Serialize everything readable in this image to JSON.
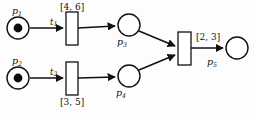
{
  "diagram": {
    "type": "timed-petri-net",
    "title": "",
    "background_color": "#fdfdfd",
    "stroke_color": "#111111",
    "token_color": "#0d0d0d"
  },
  "places": [
    {
      "id": "p1",
      "label": "p",
      "subscript": "1",
      "tokens": 1,
      "cx": 18,
      "cy": 28,
      "r": 11
    },
    {
      "id": "p2",
      "label": "p",
      "subscript": "2",
      "tokens": 1,
      "cx": 18,
      "cy": 78,
      "r": 11
    },
    {
      "id": "p3",
      "label": "p",
      "subscript": "3",
      "tokens": 0,
      "cx": 129,
      "cy": 25,
      "r": 11
    },
    {
      "id": "p4",
      "label": "p",
      "subscript": "4",
      "tokens": 0,
      "cx": 129,
      "cy": 76,
      "r": 11
    },
    {
      "id": "p5",
      "label": "p",
      "subscript": "5",
      "tokens": 0,
      "cx": 237,
      "cy": 48,
      "r": 11
    }
  ],
  "transitions": [
    {
      "id": "t1",
      "label": "t",
      "subscript": "1",
      "interval": "[4, 6]",
      "interval_position": "above",
      "x": 66,
      "y": 12,
      "w": 12,
      "h": 33
    },
    {
      "id": "t2",
      "label": "t",
      "subscript": "2",
      "interval": "[3, 5]",
      "interval_position": "below",
      "x": 66,
      "y": 62,
      "w": 12,
      "h": 33
    },
    {
      "id": "t3",
      "label": "",
      "subscript": "",
      "interval": "[2, 3]",
      "interval_position": "right",
      "x": 178,
      "y": 32,
      "w": 13,
      "h": 33
    }
  ],
  "arcs": [
    {
      "from": "p1",
      "to": "t1"
    },
    {
      "from": "t1",
      "to": "p3"
    },
    {
      "from": "p2",
      "to": "t2"
    },
    {
      "from": "t2",
      "to": "p4"
    },
    {
      "from": "p3",
      "to": "t3"
    },
    {
      "from": "p4",
      "to": "t3"
    },
    {
      "from": "t3",
      "to": "p5"
    }
  ],
  "labels": {
    "p1": "p",
    "p1_sub": "1",
    "p2": "p",
    "p2_sub": "2",
    "p3": "p",
    "p3_sub": "3",
    "p4": "p",
    "p4_sub": "4",
    "p5": "p",
    "p5_sub": "5",
    "t1": "t",
    "t1_sub": "1",
    "t2": "t",
    "t2_sub": "2",
    "interval_t1": "[4, 6]",
    "interval_t2": "[3, 5]",
    "interval_t3": "[2, 3]"
  }
}
